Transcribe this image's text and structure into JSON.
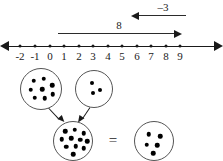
{
  "figure": {
    "background_color": "#ffffff",
    "ink_color": "#1a1a1a"
  },
  "number_line": {
    "name": "number-line",
    "min": -2,
    "max": 9,
    "left_arrowhead": true,
    "right_arrowhead": true,
    "tick_labels": [
      "-2",
      "-1",
      "0",
      "1",
      "2",
      "3",
      "4",
      "5",
      "6",
      "7",
      "8",
      "9"
    ],
    "tick_values": [
      -2,
      -1,
      0,
      1,
      2,
      3,
      4,
      5,
      6,
      7,
      8,
      9
    ],
    "tick_x": [
      20,
      35,
      50,
      64,
      79,
      93,
      108,
      122,
      137,
      151,
      166,
      180
    ],
    "jumps": [
      {
        "label": "8",
        "value": 8,
        "direction": "right",
        "from": 0,
        "to": 8,
        "label_x": 119,
        "row_y": 33,
        "x_start": 58,
        "x_end": 180
      },
      {
        "label": "–3",
        "value": -3,
        "direction": "left",
        "from": 8,
        "to": 5,
        "label_x": 163,
        "row_y": 15,
        "x_start": 133,
        "x_end": 186
      }
    ]
  },
  "dot_groups": {
    "name": "dot-group-diagram",
    "equals_label": "=",
    "equals_x": 113,
    "equals_y": 140,
    "circles": [
      {
        "name": "addend-circle-left",
        "count": 8,
        "cx": 41,
        "cy": 89,
        "r": 21,
        "pip_size": 4.5,
        "pips": [
          [
            -8.5,
            -9.5
          ],
          [
            1.5,
            -11.5
          ],
          [
            10.0,
            -5.0
          ],
          [
            -11.5,
            -0.5
          ],
          [
            0.0,
            -1.0
          ],
          [
            10.5,
            4.0
          ],
          [
            -7.5,
            7.5
          ],
          [
            2.5,
            8.0
          ]
        ]
      },
      {
        "name": "addend-circle-right",
        "count": 3,
        "cx": 94,
        "cy": 89,
        "r": 19,
        "pip_size": 4.0,
        "pips": [
          [
            -3.5,
            -7.5
          ],
          [
            4.5,
            -0.5
          ],
          [
            -2.0,
            3.0
          ]
        ]
      },
      {
        "name": "sum-circle",
        "count": 11,
        "cx": 73,
        "cy": 141,
        "r": 20,
        "pip_size": 4.5,
        "pips": [
          [
            -9.0,
            -11.0
          ],
          [
            0.5,
            -12.5
          ],
          [
            9.5,
            -9.0
          ],
          [
            -12.5,
            -3.0
          ],
          [
            -3.0,
            -4.0
          ],
          [
            6.0,
            -2.5
          ],
          [
            13.0,
            -1.0
          ],
          [
            -8.0,
            4.5
          ],
          [
            1.5,
            4.0
          ],
          [
            9.5,
            6.0
          ],
          [
            -1.0,
            12.0
          ]
        ]
      },
      {
        "name": "result-circle",
        "count": 5,
        "cx": 154,
        "cy": 141,
        "r": 20,
        "pip_size": 4.5,
        "pips": [
          [
            -6.5,
            -8.0
          ],
          [
            5.0,
            -6.0
          ],
          [
            -8.5,
            2.5
          ],
          [
            2.0,
            3.0
          ],
          [
            -2.0,
            11.0
          ]
        ]
      }
    ],
    "combine_arrows": [
      {
        "name": "combine-arrow-from-left",
        "x1": 48,
        "y1": 107,
        "x2": 62,
        "y2": 122
      },
      {
        "name": "combine-arrow-from-right",
        "x1": 90,
        "y1": 107,
        "x2": 80,
        "y2": 122
      }
    ]
  }
}
